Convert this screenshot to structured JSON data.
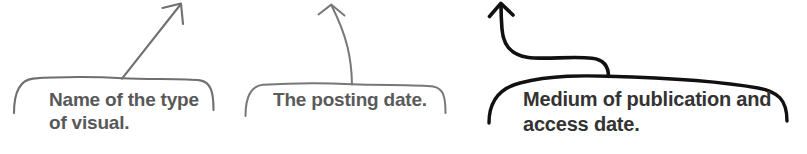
{
  "figure": {
    "kind": "annotated-callout-braces",
    "background_color": "#ffffff",
    "callouts": [
      {
        "id": "type-of-visual",
        "label": "Name of the type\nof visual.",
        "text_color": "#585858",
        "stroke_color": "#6f6f6f",
        "pointer": "diagonal-arrow-up-right",
        "brace": {
          "left": 14,
          "right": 214,
          "top": 78
        }
      },
      {
        "id": "posting-date",
        "label": "The posting date.",
        "text_color": "#5a5a5a",
        "stroke_color": "#777777",
        "pointer": "near-vertical-arrow-up",
        "brace": {
          "left": 245,
          "right": 446,
          "top": 84
        }
      },
      {
        "id": "medium-and-access-date",
        "label": "Medium of publication and\naccess date.",
        "text_color": "#333333",
        "stroke_color": "#111111",
        "pointer": "s-curve-arrow-up-left",
        "brace": {
          "left": 488,
          "right": 788,
          "top": 76
        }
      }
    ]
  }
}
